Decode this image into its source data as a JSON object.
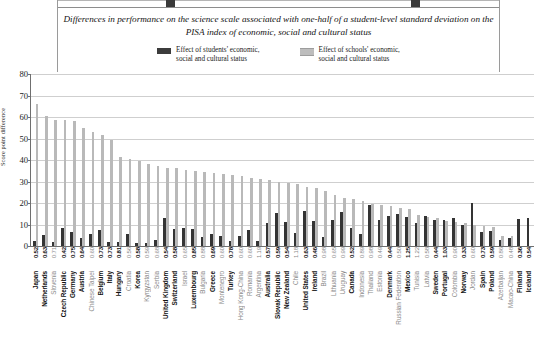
{
  "title": "Differences in performance on the science scale associated with one-half of\na student-level standard deviation on the PISA index of economic, social and cultural status",
  "legend": {
    "series_dark": "Effect of students' economic,\nsocial and cultural status",
    "series_light": "Effect of schools' economic,\nsocial and cultural status"
  },
  "colors": {
    "series_dark": "#343434",
    "series_light": "#b9b9b9",
    "grid": "#cfcfcf",
    "axis": "#6f6f6f",
    "highlight_text": "#111111",
    "dim_text": "#8a8a8a"
  },
  "chart_data": {
    "type": "bar",
    "title": "Differences in performance on the science scale associated with one-half of a student-level standard deviation on the PISA index of economic, social and cultural status",
    "xlabel": "",
    "ylabel": "Score point difference",
    "ylim": [
      0,
      80
    ],
    "yticks": [
      0,
      10,
      20,
      30,
      40,
      50,
      60,
      70,
      80
    ],
    "grid": true,
    "legend_position": "top-center",
    "categories": [
      "Japan",
      "Netherlands",
      "Slovenia",
      "Czech Republic",
      "Germany",
      "Austria",
      "Chinese Taipei",
      "Belgium",
      "Italy",
      "Hungary",
      "Croatia",
      "Korea",
      "Kyrgyzstan",
      "Serbia",
      "United Kingdom",
      "Switzerland",
      "Israel",
      "Luxembourg",
      "Bulgaria",
      "Greece",
      "Montenegro",
      "Turkey",
      "Hong Kong-China",
      "Romania",
      "Argentina",
      "Australia",
      "Slovak Republic",
      "New Zealand",
      "Chile",
      "United States",
      "Ireland",
      "Brazil",
      "Lithuania",
      "Uruguay",
      "Canada",
      "Indonesia",
      "Thailand",
      "Estonia",
      "Denmark",
      "Russian Federation",
      "Mexico",
      "Tunisia",
      "Latvia",
      "Sweden",
      "Portugal",
      "Colombia",
      "Norway",
      "Jordan",
      "Spain",
      "Poland",
      "Azerbaijan",
      "Macao-China",
      "Finland",
      "Iceland"
    ],
    "value_labels": [
      "0.52",
      "0.63",
      "0.71",
      "0.42",
      "0.75",
      "0.64",
      "0.60",
      "0.73",
      "0.73",
      "0.81",
      "0.56",
      "0.58",
      "0.59",
      "0.68",
      "0.54",
      "0.58",
      "0.65",
      "0.85",
      "0.88",
      "0.69",
      "0.60",
      "0.78",
      "0.60",
      "0.60",
      "1.19",
      "0.57",
      "0.59",
      "0.54",
      "1.18",
      "0.63",
      "0.46",
      "0.98",
      "0.65",
      "0.99",
      "0.52",
      "0.89",
      "0.98",
      "0.49",
      "0.44",
      "0.50",
      "1.25",
      "1.22",
      "0.58",
      "0.44",
      "1.03",
      "0.90",
      "0.33",
      "0.60",
      "0.73",
      "0.59",
      "0.86",
      "0.48",
      "0.36",
      "0.54"
    ],
    "highlight_flags": [
      true,
      true,
      false,
      true,
      true,
      true,
      false,
      true,
      true,
      true,
      false,
      true,
      false,
      false,
      true,
      true,
      false,
      true,
      false,
      true,
      false,
      true,
      false,
      false,
      false,
      true,
      true,
      true,
      false,
      true,
      true,
      false,
      false,
      false,
      true,
      false,
      false,
      false,
      true,
      false,
      true,
      false,
      false,
      true,
      true,
      false,
      true,
      false,
      true,
      true,
      false,
      false,
      true,
      true
    ],
    "series": [
      {
        "name": "Effect of students' economic, social and cultural status",
        "color": "#343434",
        "values": [
          2.5,
          5.0,
          2.0,
          8.5,
          6.5,
          3.5,
          5.5,
          7.5,
          2.0,
          1.8,
          5.5,
          1.5,
          1.5,
          3.0,
          13.0,
          8.0,
          8.5,
          8.0,
          4.0,
          5.5,
          4.5,
          2.5,
          4.5,
          7.5,
          2.5,
          10.5,
          15.5,
          11.0,
          6.0,
          16.5,
          11.5,
          4.0,
          12.0,
          16.0,
          8.5,
          5.5,
          19.0,
          12.0,
          14.0,
          15.0,
          13.5,
          10.5,
          14.0,
          12.0,
          12.0,
          13.0,
          10.0,
          20.0,
          6.5,
          7.0,
          3.0,
          3.5,
          12.5,
          13.0
        ]
      },
      {
        "name": "Effect of schools' economic, social and cultural status",
        "color": "#b9b9b9",
        "values": [
          66.0,
          60.5,
          58.5,
          58.5,
          58.0,
          55.0,
          53.0,
          51.5,
          49.5,
          41.5,
          40.5,
          39.5,
          38.0,
          37.0,
          36.5,
          36.5,
          35.5,
          35.0,
          34.5,
          34.0,
          33.5,
          33.0,
          32.5,
          31.5,
          31.0,
          30.5,
          30.0,
          29.5,
          29.0,
          27.5,
          27.0,
          25.5,
          23.5,
          22.5,
          22.0,
          21.0,
          19.5,
          19.0,
          18.5,
          17.5,
          17.0,
          14.5,
          13.5,
          13.0,
          11.5,
          11.0,
          10.5,
          10.0,
          9.5,
          9.0,
          4.5,
          4.5,
          0.0,
          0.0
        ]
      }
    ]
  }
}
